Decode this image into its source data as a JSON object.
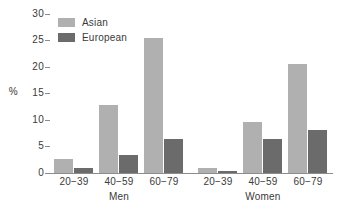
{
  "chart_data": {
    "type": "bar",
    "title": "",
    "xlabel": "",
    "ylabel": "%",
    "ylim": [
      0,
      30
    ],
    "yticks": [
      0,
      5,
      10,
      15,
      20,
      25,
      30
    ],
    "grid": false,
    "legend_position": "top-left",
    "categories": [
      "20−39",
      "40−59",
      "60−79",
      "20−39",
      "40−59",
      "60−79"
    ],
    "group_labels": [
      "Men",
      "Women"
    ],
    "groups": [
      {
        "label": "Men",
        "categories": [
          "20−39",
          "40−59",
          "60−79"
        ]
      },
      {
        "label": "Women",
        "categories": [
          "20−39",
          "40−59",
          "60−79"
        ]
      }
    ],
    "series": [
      {
        "name": "Asian",
        "color": "#b0b0b0",
        "values": [
          2.7,
          12.9,
          25.4,
          1.0,
          9.7,
          20.6
        ]
      },
      {
        "name": "European",
        "color": "#6b6b6b",
        "values": [
          0.9,
          3.4,
          6.5,
          0.4,
          6.5,
          8.1
        ]
      }
    ]
  },
  "axis": {
    "y_label": "%",
    "y_ticks": [
      "0",
      "5",
      "10",
      "15",
      "20",
      "25",
      "30"
    ],
    "x_labels": [
      "20−39",
      "40−59",
      "60−79",
      "20−39",
      "40−59",
      "60−79"
    ],
    "group_men": "Men",
    "group_women": "Women"
  },
  "legend": {
    "items": [
      {
        "label": "Asian",
        "color": "#b0b0b0"
      },
      {
        "label": "European",
        "color": "#6b6b6b"
      }
    ]
  },
  "colors": {
    "asian": "#b0b0b0",
    "european": "#6b6b6b",
    "axis": "#8c8c8c",
    "text": "#3a3a3a",
    "background": "#ffffff"
  }
}
